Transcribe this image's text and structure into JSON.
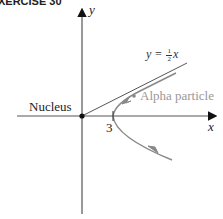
{
  "header": {
    "exercise_label": "XERCISE 30"
  },
  "axes": {
    "x_label": "x",
    "y_label": "y"
  },
  "labels": {
    "nucleus": "Nucleus",
    "vertex_tick": "3",
    "alpha_particle": "Alpha particle",
    "asymptote_lhs": "y =",
    "asymptote_frac_num": "1",
    "asymptote_frac_den": "2",
    "asymptote_rhs": "x"
  },
  "colors": {
    "axis": "#555555",
    "path": "#888888",
    "asymptote": "#555555",
    "alpha_text": "#999999",
    "nucleus_dot": "#111111"
  }
}
